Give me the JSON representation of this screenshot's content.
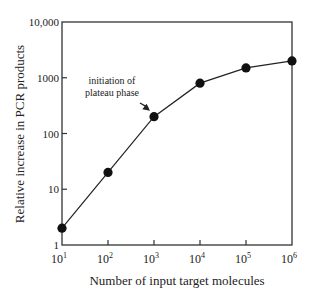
{
  "chart_data": {
    "type": "line",
    "title": "",
    "xlabel": "Number of input target molecules",
    "ylabel": "Relative increase in PCR products",
    "xscale": "log",
    "yscale": "log",
    "xlim": [
      10,
      1000000
    ],
    "ylim": [
      1,
      10000
    ],
    "x_ticks": [
      {
        "base": "10",
        "exp": "1"
      },
      {
        "base": "10",
        "exp": "2"
      },
      {
        "base": "10",
        "exp": "3"
      },
      {
        "base": "10",
        "exp": "4"
      },
      {
        "base": "10",
        "exp": "5"
      },
      {
        "base": "10",
        "exp": "6"
      }
    ],
    "y_ticks": [
      "1",
      "10",
      "100",
      "1000",
      "10,000"
    ],
    "grid": false,
    "legend": null,
    "series": [
      {
        "name": "PCR products",
        "x": [
          10,
          100,
          1000,
          10000,
          100000,
          1000000
        ],
        "values": [
          2,
          20,
          200,
          800,
          1500,
          2000
        ],
        "marker": "filled-circle",
        "color": "#111111"
      }
    ],
    "annotations": [
      {
        "text_lines": [
          "initiation of",
          "plateau phase"
        ],
        "points_to": {
          "x": 1000,
          "y": 200
        },
        "arrow": true
      }
    ]
  }
}
